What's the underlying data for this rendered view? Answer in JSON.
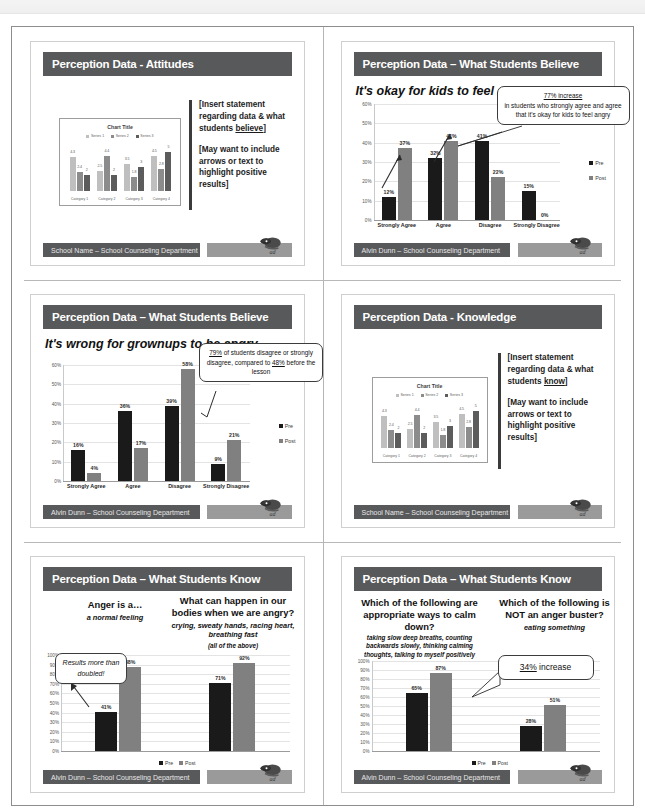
{
  "document": {
    "scan_header_left": "",
    "colors": {
      "title_bar": "#58595b",
      "footer_bar": "#58595b",
      "footer_logo_bar": "#9a9a9a",
      "bar_pre": "#1a1a1a",
      "bar_post": "#808080"
    }
  },
  "slides": [
    {
      "id": "slide-1",
      "title": "Perception Data - Attitudes",
      "footer": "School Name – School Counseling Department",
      "note": [
        "[Insert statement regarding data & what students believe]",
        "[May want to include arrows or text to highlight positive results]"
      ],
      "note_underline_word": "believe",
      "placeholder_chart": {
        "title": "Chart Title",
        "legend": [
          "Series 1",
          "Series 2",
          "Series 3"
        ],
        "categories": [
          "Category 1",
          "Category 2",
          "Category 3",
          "Category 4"
        ],
        "series": [
          {
            "name": "Series 1",
            "values": [
              4.3,
              2.5,
              3.5,
              4.5
            ]
          },
          {
            "name": "Series 2",
            "values": [
              2.4,
              4.4,
              1.8,
              2.8
            ]
          },
          {
            "name": "Series 3",
            "values": [
              2,
              2,
              3,
              5
            ]
          }
        ]
      }
    },
    {
      "id": "slide-2",
      "title": "Perception Data – What Students Believe",
      "headline": "It's okay for kids to feel angry",
      "footer": "Alvin Dunn – School Counseling Department",
      "callout": {
        "lead": "77% increase",
        "body": "in students who strongly agree and agree that it's okay for kids to feel angry"
      },
      "legend": [
        "Pre",
        "Post"
      ]
    },
    {
      "id": "slide-3",
      "title": "Perception Data – What Students Believe",
      "headline": "It's wrong for grownups to be angry",
      "footer": "Alvin Dunn – School Counseling Department",
      "callout": {
        "part1": "79%",
        "part2": " of students disagree or strongly disagree, compared to ",
        "part3": "48%",
        "part4": " before the lesson"
      },
      "legend": [
        "Pre",
        "Post"
      ]
    },
    {
      "id": "slide-4",
      "title": "Perception Data - Knowledge",
      "footer": "School Name – School Counseling Department",
      "note": [
        "[Insert statement regarding data & what students know]",
        "[May want to include arrows or text to highlight positive results]"
      ],
      "note_underline_word": "know",
      "placeholder_chart": {
        "title": "Chart Title",
        "legend": [
          "Series 1",
          "Series 2",
          "Series 3"
        ],
        "categories": [
          "Category 1",
          "Category 2",
          "Category 3",
          "Category 4"
        ],
        "series": [
          {
            "name": "Series 1",
            "values": [
              4.3,
              2.5,
              3.5,
              4.5
            ]
          },
          {
            "name": "Series 2",
            "values": [
              2.4,
              4.4,
              1.8,
              2.8
            ]
          },
          {
            "name": "Series 3",
            "values": [
              2,
              2,
              3,
              5
            ]
          }
        ]
      }
    },
    {
      "id": "slide-5",
      "title": "Perception Data – What Students Know",
      "footer": "Alvin Dunn – School Counseling Department",
      "questions": [
        {
          "q": "Anger is a…",
          "a": "a normal feeling"
        },
        {
          "q": "What can happen in our bodies when we are angry?",
          "a": "crying, sweaty hands, racing heart, breathing fast",
          "a2": "(all of the above)"
        }
      ],
      "callout": "Results more than doubled!",
      "legend": [
        "Pre",
        "Post"
      ]
    },
    {
      "id": "slide-6",
      "title": "Perception Data – What Students Know",
      "footer": "Alvin Dunn – School Counseling Department",
      "questions": [
        {
          "q": "Which of the following are appropriate ways to calm down?",
          "a": "taking slow deep breaths, counting backwards slowly, thinking calming thoughts, talking to myself positively"
        },
        {
          "q": "Which of the following is NOT an anger buster?",
          "a": "eating something"
        }
      ],
      "callout": "34% increase",
      "callout_underline": "34%",
      "legend": [
        "Pre",
        "Post"
      ]
    }
  ],
  "chart_data": [
    {
      "id": "chart-slide-2",
      "type": "bar",
      "title": "It's okay for kids to feel angry",
      "categories": [
        "Strongly Agree",
        "Agree",
        "Disagree",
        "Strongly Disagree"
      ],
      "series": [
        {
          "name": "Pre",
          "values": [
            12,
            32,
            41,
            15
          ]
        },
        {
          "name": "Post",
          "values": [
            37,
            41,
            22,
            0
          ]
        }
      ],
      "data_labels": [
        [
          "12%",
          "37%"
        ],
        [
          "32%",
          "41%"
        ],
        [
          "41%",
          "22%"
        ],
        [
          "15%",
          "0%"
        ]
      ],
      "ylabel": "",
      "xlabel": "",
      "ylim": [
        0,
        60
      ],
      "yticks": [
        "0%",
        "10%",
        "20%",
        "30%",
        "40%",
        "50%",
        "60%"
      ],
      "grid": true,
      "legend": [
        "Pre",
        "Post"
      ],
      "legend_position": "right"
    },
    {
      "id": "chart-slide-3",
      "type": "bar",
      "title": "It's wrong for grownups to be angry",
      "categories": [
        "Strongly Agree",
        "Agree",
        "Disagree",
        "Strongly Disagree"
      ],
      "series": [
        {
          "name": "Pre",
          "values": [
            16,
            36,
            39,
            9
          ]
        },
        {
          "name": "Post",
          "values": [
            4,
            17,
            58,
            21
          ]
        }
      ],
      "data_labels": [
        [
          "16%",
          "4%"
        ],
        [
          "36%",
          "17%"
        ],
        [
          "39%",
          "58%"
        ],
        [
          "9%",
          "21%"
        ]
      ],
      "ylabel": "",
      "xlabel": "",
      "ylim": [
        0,
        60
      ],
      "yticks": [
        "0%",
        "10%",
        "20%",
        "30%",
        "40%",
        "50%",
        "60%"
      ],
      "grid": true,
      "legend": [
        "Pre",
        "Post"
      ],
      "legend_position": "right"
    },
    {
      "id": "chart-slide-5",
      "type": "bar",
      "title": "Perception Data – What Students Know",
      "categories": [
        "Anger is a… a normal feeling",
        "What can happen in our bodies when we are angry?"
      ],
      "series": [
        {
          "name": "Pre",
          "values": [
            41,
            71
          ]
        },
        {
          "name": "Post",
          "values": [
            88,
            92
          ]
        }
      ],
      "data_labels": [
        [
          "41%",
          "88%"
        ],
        [
          "71%",
          "92%"
        ]
      ],
      "ylim": [
        0,
        100
      ],
      "yticks": [
        "0%",
        "10%",
        "20%",
        "30%",
        "40%",
        "50%",
        "60%",
        "70%",
        "80%",
        "90%",
        "100%"
      ],
      "grid": true,
      "legend": [
        "Pre",
        "Post"
      ],
      "legend_position": "bottom"
    },
    {
      "id": "chart-slide-6",
      "type": "bar",
      "title": "Perception Data – What Students Know",
      "categories": [
        "Which of the following are appropriate ways to calm down?",
        "Which of the following is NOT an anger buster?"
      ],
      "series": [
        {
          "name": "Pre",
          "values": [
            65,
            28
          ]
        },
        {
          "name": "Post",
          "values": [
            87,
            51
          ]
        }
      ],
      "data_labels": [
        [
          "65%",
          "87%"
        ],
        [
          "28%",
          "51%"
        ]
      ],
      "ylim": [
        0,
        100
      ],
      "yticks": [
        "0%",
        "10%",
        "20%",
        "30%",
        "40%",
        "50%",
        "60%",
        "70%",
        "80%",
        "90%",
        "100%"
      ],
      "grid": true,
      "legend": [
        "Pre",
        "Post"
      ],
      "legend_position": "bottom"
    }
  ]
}
